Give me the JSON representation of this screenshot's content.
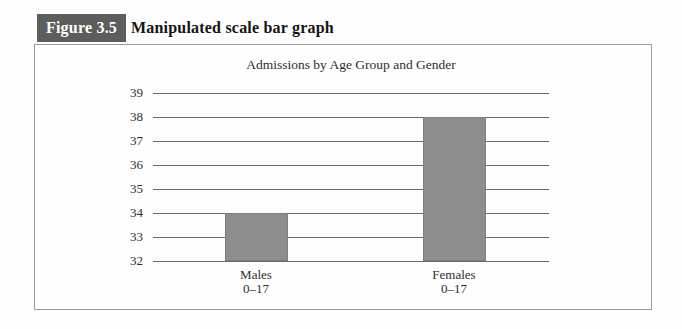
{
  "header": {
    "figure_label": "Figure 3.5",
    "figure_title": "Manipulated scale bar graph"
  },
  "chart_data": {
    "type": "bar",
    "title": "Admissions by Age Group and Gender",
    "categories": [
      [
        "Males",
        "0–17"
      ],
      [
        "Females",
        "0–17"
      ]
    ],
    "values": [
      34,
      38
    ],
    "xlabel": "",
    "ylabel": "",
    "ylim": [
      32,
      39
    ],
    "yticks": [
      32,
      33,
      34,
      35,
      36,
      37,
      38,
      39
    ],
    "grid": true,
    "legend": "none",
    "note": "truncated y-axis starting at 32 (manipulated scale)",
    "bar_color": "#8d8d8d",
    "gridline_color": "#686868"
  },
  "colors": {
    "figure_label_bg": "#5d5d5d",
    "figure_label_text": "#ffffff",
    "box_border": "#9b9b9b"
  }
}
